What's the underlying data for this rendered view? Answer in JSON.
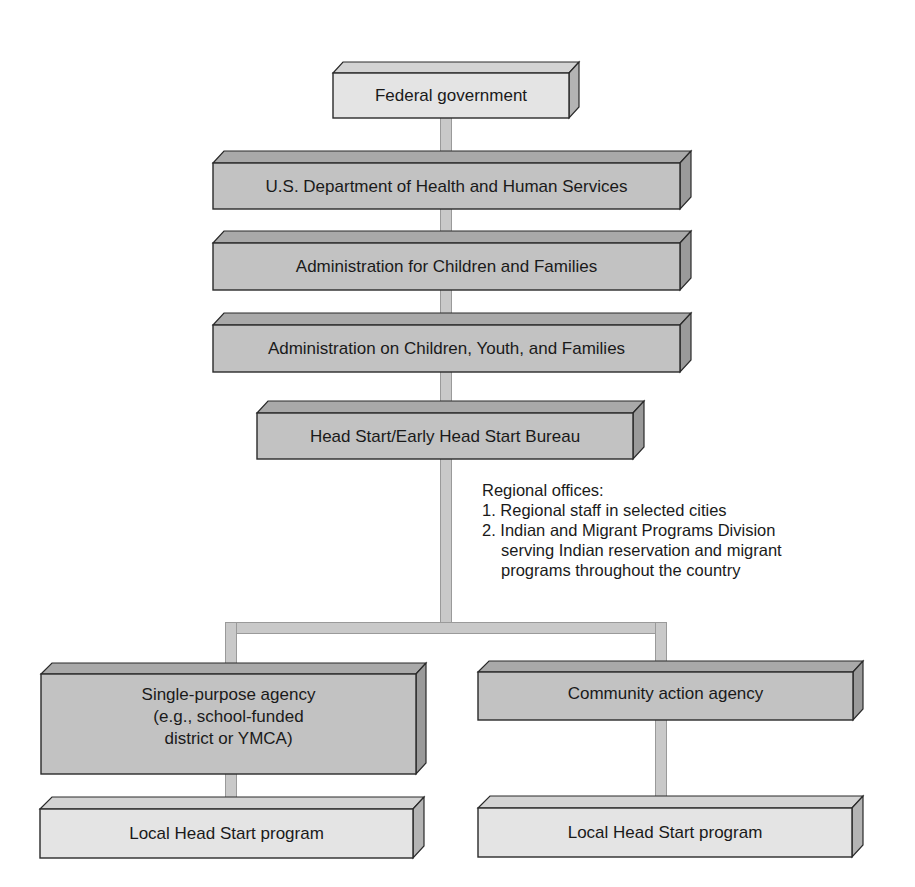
{
  "diagram": {
    "type": "org-chart",
    "nodes": [
      {
        "id": "federal",
        "label": "Federal government",
        "shade": "light"
      },
      {
        "id": "hhs",
        "label": "U.S. Department of Health and Human Services",
        "shade": "dark"
      },
      {
        "id": "acf",
        "label": "Administration for Children and Families",
        "shade": "dark"
      },
      {
        "id": "acyf",
        "label": "Administration on Children, Youth, and Families",
        "shade": "dark"
      },
      {
        "id": "bureau",
        "label": "Head Start/Early Head Start Bureau",
        "shade": "dark"
      },
      {
        "id": "single",
        "label": "Single-purpose agency\n(e.g., school-funded\ndistrict or YMCA)",
        "shade": "dark"
      },
      {
        "id": "community",
        "label": "Community action agency",
        "shade": "dark"
      },
      {
        "id": "local_left",
        "label": "Local Head Start program",
        "shade": "light"
      },
      {
        "id": "local_right",
        "label": "Local Head Start program",
        "shade": "light"
      }
    ],
    "edges": [
      [
        "federal",
        "hhs"
      ],
      [
        "hhs",
        "acf"
      ],
      [
        "acf",
        "acyf"
      ],
      [
        "acyf",
        "bureau"
      ],
      [
        "bureau",
        "single"
      ],
      [
        "bureau",
        "community"
      ],
      [
        "single",
        "local_left"
      ],
      [
        "community",
        "local_right"
      ]
    ],
    "note": {
      "title": "Regional offices:",
      "items": [
        "1. Regional staff in selected cities",
        "2. Indian and Migrant Programs Division",
        "serving Indian reservation and migrant",
        "programs throughout the country"
      ]
    },
    "colors": {
      "light_face": "#e4e4e4",
      "dark_face": "#bdbdbd",
      "connector": "#c9c9c9",
      "outline": "#2a2a2a"
    }
  }
}
